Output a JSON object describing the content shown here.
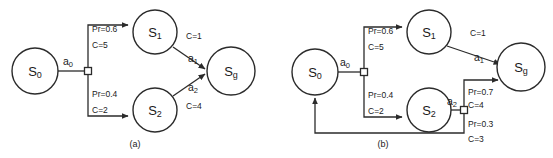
{
  "figure": {
    "background_color": "#ffffff",
    "stroke_color": "#2b2b2b",
    "text_color": "#1a1a1a",
    "width": 553,
    "height": 158
  },
  "panels": [
    {
      "id": "panel-a",
      "caption": "(a)",
      "nodes": [
        {
          "id": "s0",
          "base": "S",
          "sub": "0",
          "cx": 35,
          "cy": 71,
          "r": 23
        },
        {
          "id": "s1",
          "base": "S",
          "sub": "1",
          "cx": 155,
          "cy": 32,
          "r": 22
        },
        {
          "id": "s2",
          "base": "S",
          "sub": "2",
          "cx": 155,
          "cy": 110,
          "r": 22
        },
        {
          "id": "sg",
          "base": "S",
          "sub": "g",
          "cx": 231,
          "cy": 71,
          "r": 24
        }
      ],
      "junctions": [
        {
          "id": "junction-a0",
          "x": 88,
          "y": 71,
          "size": 7
        }
      ],
      "actions": [
        {
          "id": "a0",
          "base": "a",
          "sub": "0",
          "x": 68,
          "y": 61
        },
        {
          "id": "a1",
          "base": "a",
          "sub": "1",
          "x": 193,
          "y": 58
        },
        {
          "id": "a2",
          "base": "a",
          "sub": "2",
          "x": 193,
          "y": 87
        }
      ],
      "edge_labels": [
        {
          "id": "branch-up-prob",
          "text": "Pr=0.6",
          "x": 92,
          "y": 29
        },
        {
          "id": "branch-up-cost",
          "text": "C=5",
          "x": 92,
          "y": 45
        },
        {
          "id": "branch-down-prob",
          "text": "Pr=0.4",
          "x": 92,
          "y": 94
        },
        {
          "id": "branch-down-cost",
          "text": "C=2",
          "x": 92,
          "y": 110
        },
        {
          "id": "s1-goal-cost",
          "text": "C=1",
          "x": 186,
          "y": 36
        },
        {
          "id": "s2-goal-cost",
          "text": "C=4",
          "x": 186,
          "y": 106
        }
      ]
    },
    {
      "id": "panel-b",
      "caption": "(b)",
      "nodes": [
        {
          "id": "s0",
          "base": "S",
          "sub": "0",
          "cx": 315,
          "cy": 72,
          "r": 23
        },
        {
          "id": "s1",
          "base": "S",
          "sub": "1",
          "cx": 429,
          "cy": 32,
          "r": 22
        },
        {
          "id": "s2",
          "base": "S",
          "sub": "2",
          "cx": 429,
          "cy": 110,
          "r": 22
        },
        {
          "id": "sg",
          "base": "S",
          "sub": "g",
          "cx": 521,
          "cy": 67,
          "r": 24
        }
      ],
      "junctions": [
        {
          "id": "junction-a0",
          "x": 364,
          "y": 72,
          "size": 7
        },
        {
          "id": "junction-a2",
          "x": 464,
          "y": 110,
          "size": 7
        }
      ],
      "actions": [
        {
          "id": "a0",
          "base": "a",
          "sub": "0",
          "x": 345,
          "y": 62
        },
        {
          "id": "a1",
          "base": "a",
          "sub": "1",
          "x": 479,
          "y": 57
        },
        {
          "id": "a2",
          "base": "a",
          "sub": "2",
          "x": 452,
          "y": 101
        }
      ],
      "edge_labels": [
        {
          "id": "branch-up-prob",
          "text": "Pr=0.6",
          "x": 368,
          "y": 31
        },
        {
          "id": "branch-up-cost",
          "text": "C=5",
          "x": 368,
          "y": 47
        },
        {
          "id": "branch-down-prob",
          "text": "Pr=0.4",
          "x": 368,
          "y": 95
        },
        {
          "id": "branch-down-cost",
          "text": "C=2",
          "x": 368,
          "y": 111
        },
        {
          "id": "s1-goal-cost",
          "text": "C=1",
          "x": 470,
          "y": 33
        },
        {
          "id": "goal-branch-prob",
          "text": "Pr=0.7",
          "x": 468,
          "y": 92
        },
        {
          "id": "goal-branch-cost",
          "text": "C=4",
          "x": 468,
          "y": 105
        },
        {
          "id": "loop-branch-prob",
          "text": "Pr=0.3",
          "x": 468,
          "y": 124
        },
        {
          "id": "loop-branch-cost",
          "text": "C=3",
          "x": 468,
          "y": 139
        }
      ]
    }
  ]
}
